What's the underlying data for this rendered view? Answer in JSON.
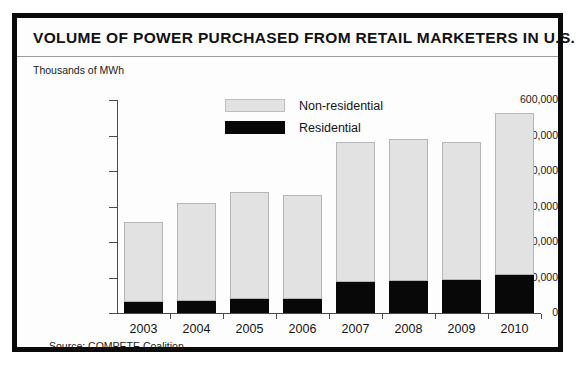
{
  "figure": {
    "title": "VOLUME OF POWER PURCHASED FROM RETAIL MARKETERS IN U.S.",
    "unit_label": "Thousands of MWh",
    "source": "Source: COMPETE Coalition",
    "border_color": "#0a0a0a",
    "background_color": "#ffffff"
  },
  "legend": {
    "position": "top-center",
    "entries": [
      {
        "label": "Non-residential",
        "color": "#e2e2e2",
        "swatch": "light-gray-filled-rect"
      },
      {
        "label": "Residential",
        "color": "#070707",
        "swatch": "black-filled-rect"
      }
    ]
  },
  "chart_data": {
    "type": "bar",
    "stacked": true,
    "title": "VOLUME OF POWER PURCHASED FROM RETAIL MARKETERS IN U.S.",
    "subtitle": "",
    "xlabel": "",
    "ylabel": "Thousands of MWh",
    "categories": [
      "2003",
      "2004",
      "2005",
      "2006",
      "2007",
      "2008",
      "2009",
      "2010"
    ],
    "series": [
      {
        "name": "Residential",
        "color": "#070707",
        "values": [
          30000,
          33000,
          40000,
          40000,
          88000,
          90000,
          93000,
          108000
        ]
      },
      {
        "name": "Non-residential",
        "color": "#e2e2e2",
        "values": [
          225000,
          277000,
          300000,
          292000,
          394000,
          400000,
          390000,
          455000
        ]
      }
    ],
    "totals": [
      255000,
      310000,
      340000,
      332000,
      482000,
      490000,
      483000,
      563000
    ],
    "ylim": [
      0,
      600000
    ],
    "yticks": [
      0,
      100000,
      200000,
      300000,
      400000,
      500000,
      600000
    ],
    "ytick_labels": [
      "0",
      "100,000",
      "200,000",
      "300,000",
      "400,000",
      "500,000",
      "600,000"
    ],
    "grid": false,
    "legend_position": "top-center",
    "source": "Source: COMPETE Coalition"
  }
}
